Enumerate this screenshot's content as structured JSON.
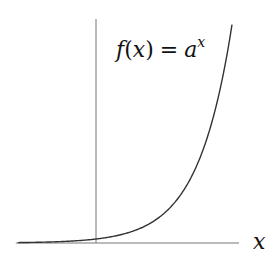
{
  "chart_data": {
    "type": "line",
    "title": "",
    "function_label": {
      "f": "f",
      "open": "(",
      "var": "x",
      "close": ")",
      "eq": "=",
      "base": "a",
      "exp": "x"
    },
    "xlabel": "x",
    "ylabel": "",
    "series": [
      {
        "name": "f(x) = a^x",
        "base": 2.718,
        "x_range": [
          -2.3,
          4.0
        ]
      }
    ],
    "xlim": [
      -2.3,
      4.5
    ],
    "ylim": [
      0,
      67
    ],
    "grid": false,
    "legend": "none",
    "colors": {
      "curve": "#333333",
      "axis": "#777777",
      "text": "#111111"
    }
  }
}
